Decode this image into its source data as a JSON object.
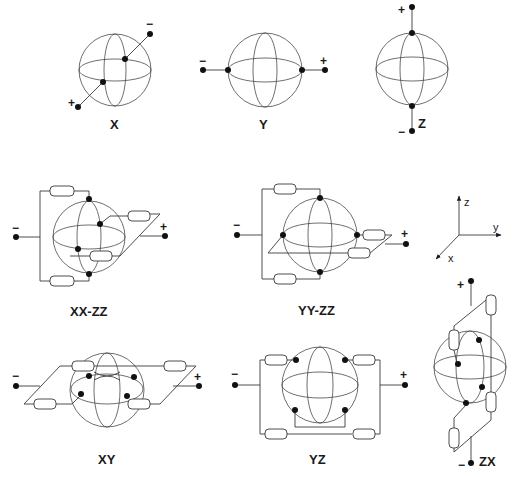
{
  "figure": {
    "panels": [
      {
        "id": "X",
        "label": "X",
        "plus": "+",
        "minus": "−"
      },
      {
        "id": "Y",
        "label": "Y",
        "plus": "+",
        "minus": "−"
      },
      {
        "id": "Z",
        "label": "Z",
        "plus": "+",
        "minus": "−"
      },
      {
        "id": "XX-ZZ",
        "label": "XX-ZZ",
        "plus": "+",
        "minus": "−"
      },
      {
        "id": "YY-ZZ",
        "label": "YY-ZZ",
        "plus": "+",
        "minus": "−"
      },
      {
        "id": "XY",
        "label": "XY",
        "plus": "+",
        "minus": "−"
      },
      {
        "id": "YZ",
        "label": "YZ",
        "plus": "+",
        "minus": "−"
      },
      {
        "id": "ZX",
        "label": "ZX",
        "plus": "+",
        "minus": "−"
      }
    ],
    "axes": {
      "x": "x",
      "y": "y",
      "z": "z"
    }
  }
}
